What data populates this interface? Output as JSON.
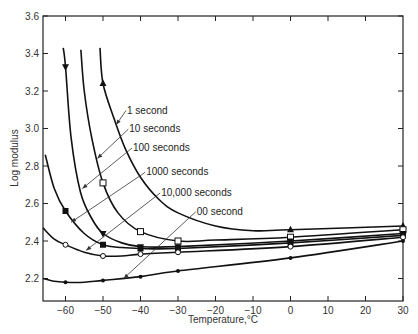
{
  "chart_data": {
    "type": "line",
    "title": "",
    "xlabel": "Temperature,°C",
    "ylabel": "Log modulus",
    "xlim": [
      -66,
      30
    ],
    "ylim": [
      2.08,
      3.6
    ],
    "x_ticks": [
      -60,
      -50,
      -40,
      -30,
      -20,
      -10,
      0,
      10,
      20,
      30
    ],
    "x_tick_labels": [
      "−60",
      "−50",
      "−40",
      "−30",
      "−20",
      "−10",
      "0",
      "10",
      "20",
      "30"
    ],
    "y_ticks": [
      2.2,
      2.4,
      2.6,
      2.8,
      3.0,
      3.2,
      3.4,
      3.6
    ],
    "y_tick_labels": [
      "2.2",
      "2.4",
      "2.6",
      "2.8",
      "3.0",
      "3.2",
      "3.4",
      "3.6"
    ],
    "grid": false,
    "legend": "inline leader-line labels",
    "series": [
      {
        "name": "1 second",
        "marker": "triangle-up",
        "curve": [
          [
            -50.8,
            3.43
          ],
          [
            -50,
            3.24
          ],
          [
            -47,
            3.05
          ],
          [
            -44,
            2.89
          ],
          [
            -40,
            2.74
          ],
          [
            -35,
            2.62
          ],
          [
            -30,
            2.55
          ],
          [
            -20,
            2.48
          ],
          [
            -10,
            2.455
          ],
          [
            0,
            2.46
          ],
          [
            30,
            2.48
          ]
        ],
        "points": [
          {
            "x": -50,
            "y": 3.24
          },
          {
            "x": 0,
            "y": 2.46
          },
          {
            "x": 30,
            "y": 2.48
          }
        ]
      },
      {
        "name": "10 seconds",
        "marker": "open-square",
        "curve": [
          [
            -55.9,
            3.42
          ],
          [
            -55,
            3.2
          ],
          [
            -53,
            2.95
          ],
          [
            -50,
            2.71
          ],
          [
            -46,
            2.55
          ],
          [
            -40,
            2.45
          ],
          [
            -30,
            2.4
          ],
          [
            -20,
            2.405
          ],
          [
            0,
            2.42
          ],
          [
            30,
            2.46
          ]
        ],
        "points": [
          {
            "x": -50,
            "y": 2.71
          },
          {
            "x": -40,
            "y": 2.45
          },
          {
            "x": -30,
            "y": 2.4
          },
          {
            "x": 0,
            "y": 2.42
          },
          {
            "x": 30,
            "y": 2.46
          }
        ]
      },
      {
        "name": "100 seconds",
        "marker": "triangle-down",
        "curve": [
          [
            -60.6,
            3.43
          ],
          [
            -60,
            3.33
          ],
          [
            -58.5,
            2.95
          ],
          [
            -56,
            2.66
          ],
          [
            -53,
            2.52
          ],
          [
            -50,
            2.44
          ],
          [
            -45,
            2.39
          ],
          [
            -40,
            2.37
          ],
          [
            -30,
            2.37
          ],
          [
            0,
            2.4
          ],
          [
            30,
            2.44
          ]
        ],
        "points": [
          {
            "x": -60,
            "y": 3.33
          },
          {
            "x": -50,
            "y": 2.44
          },
          {
            "x": -40,
            "y": 2.37
          },
          {
            "x": -30,
            "y": 2.37
          },
          {
            "x": 0,
            "y": 2.4
          },
          {
            "x": 30,
            "y": 2.44
          }
        ]
      },
      {
        "name": "1000 seconds",
        "marker": "filled-square",
        "curve": [
          [
            -65.4,
            2.86
          ],
          [
            -63,
            2.68
          ],
          [
            -60,
            2.56
          ],
          [
            -55,
            2.44
          ],
          [
            -50,
            2.38
          ],
          [
            -45,
            2.365
          ],
          [
            -40,
            2.36
          ],
          [
            -30,
            2.36
          ],
          [
            0,
            2.39
          ],
          [
            30,
            2.43
          ]
        ],
        "points": [
          {
            "x": -60,
            "y": 2.56
          },
          {
            "x": -50,
            "y": 2.38
          },
          {
            "x": -40,
            "y": 2.36
          },
          {
            "x": -30,
            "y": 2.36
          },
          {
            "x": 0,
            "y": 2.39
          },
          {
            "x": 30,
            "y": 2.43
          }
        ]
      },
      {
        "name": "10,000 seconds",
        "marker": "open-circle",
        "curve": [
          [
            -66,
            2.47
          ],
          [
            -63,
            2.41
          ],
          [
            -60,
            2.38
          ],
          [
            -55,
            2.34
          ],
          [
            -50,
            2.32
          ],
          [
            -45,
            2.32
          ],
          [
            -40,
            2.33
          ],
          [
            -30,
            2.34
          ],
          [
            0,
            2.37
          ],
          [
            30,
            2.42
          ]
        ],
        "points": [
          {
            "x": -60,
            "y": 2.38
          },
          {
            "x": -50,
            "y": 2.32
          },
          {
            "x": -40,
            "y": 2.33
          },
          {
            "x": -30,
            "y": 2.34
          },
          {
            "x": 0,
            "y": 2.37
          },
          {
            "x": 30,
            "y": 2.42
          }
        ]
      },
      {
        "name": "00 second",
        "marker": "filled-dot",
        "curve": [
          [
            -66,
            2.2
          ],
          [
            -63,
            2.185
          ],
          [
            -60,
            2.18
          ],
          [
            -55,
            2.18
          ],
          [
            -50,
            2.19
          ],
          [
            -40,
            2.21
          ],
          [
            -30,
            2.24
          ],
          [
            0,
            2.31
          ],
          [
            30,
            2.4
          ]
        ],
        "points": [
          {
            "x": -60,
            "y": 2.18
          },
          {
            "x": -50,
            "y": 2.19
          },
          {
            "x": -40,
            "y": 2.21
          },
          {
            "x": -30,
            "y": 2.24
          },
          {
            "x": 0,
            "y": 2.31
          },
          {
            "x": 30,
            "y": 2.4
          }
        ]
      }
    ],
    "annotations": [
      {
        "text": "1 second",
        "label_pos": [
          -43.6,
          3.08
        ],
        "leader_to": [
          -46.5,
          3.02
        ]
      },
      {
        "text": "10 seconds",
        "label_pos": [
          -43,
          2.98
        ],
        "leader_to": [
          -51.5,
          2.84
        ]
      },
      {
        "text": "100 seconds",
        "label_pos": [
          -42,
          2.88
        ],
        "leader_to": [
          -55.5,
          2.68
        ]
      },
      {
        "text": "1000 seconds",
        "label_pos": [
          -38.5,
          2.75
        ],
        "leader_to": [
          -58.5,
          2.5
        ]
      },
      {
        "text": "10,000 seconds",
        "label_pos": [
          -34.5,
          2.64
        ],
        "leader_to": [
          -54.5,
          2.35
        ]
      },
      {
        "text": "00 second",
        "label_pos": [
          -25,
          2.54
        ],
        "leader_to": [
          -44.5,
          2.2
        ]
      }
    ]
  },
  "axes": {
    "xlabel": "Temperature,°C",
    "ylabel": "Log modulus"
  }
}
